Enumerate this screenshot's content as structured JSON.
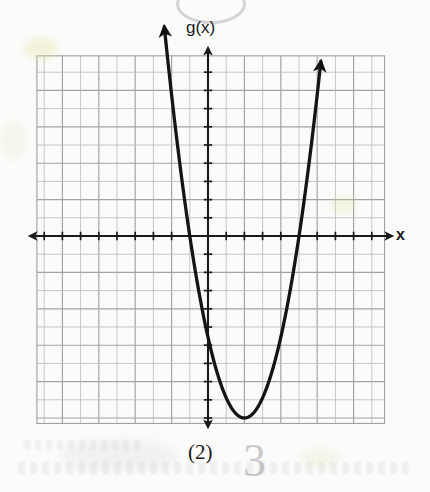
{
  "page": {
    "kind": "math-worksheet-graph",
    "background_color": "#fbfbfa",
    "ink_color": "#1a1a1a",
    "grid_color": "#9a9a9a",
    "grid_minor_color": "#c4c4c4"
  },
  "labels": {
    "y_axis": "g(x)",
    "x_axis": "x",
    "choice": "(2)",
    "handwritten_answer": "3"
  },
  "chart_data": {
    "type": "line",
    "title": "",
    "subtitle": "",
    "xlabel": "x",
    "ylabel": "g(x)",
    "xlim": [
      -9.4,
      9.7
    ],
    "ylim": [
      -10.3,
      9.9
    ],
    "grid": true,
    "grid_step": 1,
    "legend": "none",
    "axis_arrows": [
      "left",
      "right",
      "up",
      "down"
    ],
    "tick_marks": {
      "x_axis": "every 1 unit",
      "y_axis": "every 1 unit",
      "labeled": false
    },
    "function_label": "g(x)",
    "curve": {
      "shape": "parabola",
      "opens": "up",
      "vertex": [
        2,
        -10
      ],
      "x_intercepts": [
        -1,
        5
      ],
      "leading_coefficient": 1.11,
      "equation_approx": "g(x) = (10/9)(x - 2)^2 - 10",
      "endpoints_have_arrows": true,
      "left_arrow_tip": [
        -2.4,
        9.6
      ],
      "right_arrow_tip": [
        6.2,
        9.6
      ]
    },
    "series": [
      {
        "name": "g(x)",
        "x": [
          -2.4,
          -2.0,
          -1.5,
          -1.0,
          -0.5,
          0.0,
          0.5,
          1.0,
          1.5,
          2.0,
          2.5,
          3.0,
          3.5,
          4.0,
          4.5,
          5.0,
          5.5,
          6.0,
          6.2
        ],
        "y": [
          11.8,
          7.8,
          3.6,
          0.0,
          -3.1,
          -5.6,
          -7.5,
          -8.9,
          -9.7,
          -10.0,
          -9.7,
          -8.9,
          -7.5,
          -5.6,
          -3.1,
          0.0,
          3.6,
          7.8,
          9.6
        ]
      }
    ]
  }
}
